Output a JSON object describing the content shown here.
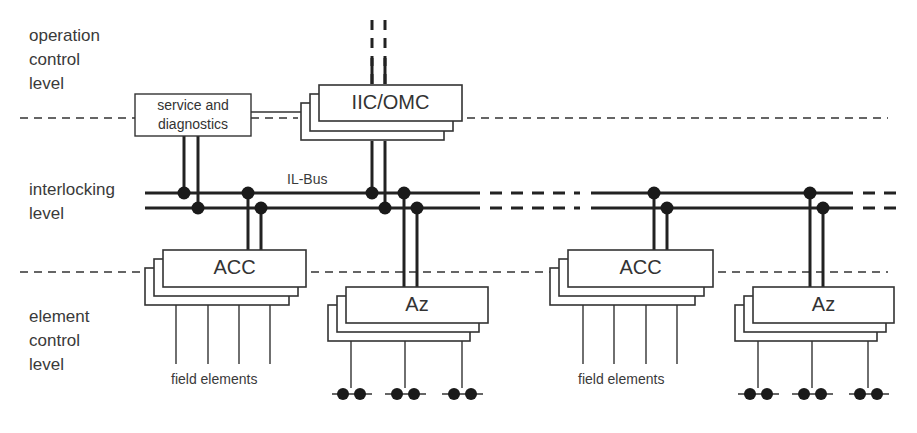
{
  "diagram": {
    "levels": {
      "operation": [
        "operation",
        "control",
        "level"
      ],
      "interlocking": [
        "interlocking",
        "level"
      ],
      "element": [
        "element",
        "control",
        "level"
      ]
    },
    "bus_label": "IL-Bus",
    "boxes": {
      "service": [
        "service and",
        "diagnostics"
      ],
      "iic_omc": "IIC/OMC",
      "acc_left": "ACC",
      "az_left": "Az",
      "acc_right": "ACC",
      "az_right": "Az"
    },
    "field_elements_labels": {
      "left": "field elements",
      "right": "field elements"
    },
    "colors": {
      "line": "#222222",
      "text": "#333333",
      "background": "#ffffff"
    }
  }
}
